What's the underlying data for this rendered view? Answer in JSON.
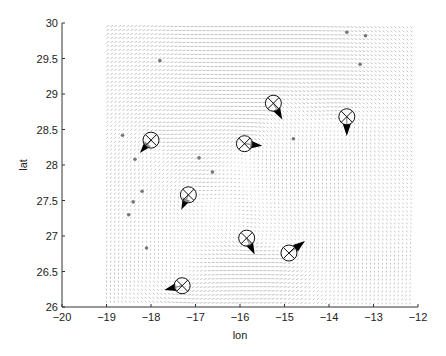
{
  "chart_data": {
    "type": "scatter",
    "title": "",
    "xlabel": "lon",
    "ylabel": "lat",
    "xlim": [
      -20,
      -12
    ],
    "ylim": [
      26,
      30
    ],
    "xticks": [
      "-20",
      "-19",
      "-18",
      "-17",
      "-16",
      "-15",
      "-14",
      "-13",
      "-12"
    ],
    "yticks": [
      "26",
      "26.5",
      "27",
      "27.5",
      "28",
      "28.5",
      "29",
      "29.5",
      "30"
    ],
    "grid": false,
    "legend": null,
    "background_field": {
      "description": "dense quiver vector field",
      "lon_range": [
        -19,
        -12.1
      ],
      "lat_range": [
        26.05,
        29.95
      ],
      "color": "#9a9a9a"
    },
    "drifter_markers": [
      {
        "lon": -18.0,
        "lat": 28.35,
        "arrow_dlon": -0.25,
        "arrow_dlat": -0.18
      },
      {
        "lon": -17.16,
        "lat": 27.58,
        "arrow_dlon": -0.16,
        "arrow_dlat": -0.21
      },
      {
        "lon": -15.9,
        "lat": 28.3,
        "arrow_dlon": 0.4,
        "arrow_dlat": -0.03
      },
      {
        "lon": -15.25,
        "lat": 28.87,
        "arrow_dlon": 0.2,
        "arrow_dlat": -0.23
      },
      {
        "lon": -13.6,
        "lat": 28.68,
        "arrow_dlon": 0.0,
        "arrow_dlat": -0.27
      },
      {
        "lon": -15.85,
        "lat": 26.97,
        "arrow_dlon": 0.18,
        "arrow_dlat": -0.23
      },
      {
        "lon": -14.9,
        "lat": 26.76,
        "arrow_dlon": 0.36,
        "arrow_dlat": 0.17
      },
      {
        "lon": -17.3,
        "lat": 26.3,
        "arrow_dlon": -0.4,
        "arrow_dlat": -0.06
      }
    ],
    "station_dots": [
      {
        "lon": -17.8,
        "lat": 29.47
      },
      {
        "lon": -13.3,
        "lat": 29.42
      },
      {
        "lon": -13.6,
        "lat": 29.87
      },
      {
        "lon": -13.18,
        "lat": 29.82
      },
      {
        "lon": -18.64,
        "lat": 28.42
      },
      {
        "lon": -14.8,
        "lat": 28.37
      },
      {
        "lon": -18.36,
        "lat": 28.08
      },
      {
        "lon": -16.92,
        "lat": 28.1
      },
      {
        "lon": -16.62,
        "lat": 27.9
      },
      {
        "lon": -18.2,
        "lat": 27.63
      },
      {
        "lon": -18.4,
        "lat": 27.48
      },
      {
        "lon": -18.5,
        "lat": 27.3
      },
      {
        "lon": -18.1,
        "lat": 26.83
      },
      {
        "lon": -14.7,
        "lat": 26.82
      }
    ]
  },
  "axis": {
    "color": "#333333"
  }
}
